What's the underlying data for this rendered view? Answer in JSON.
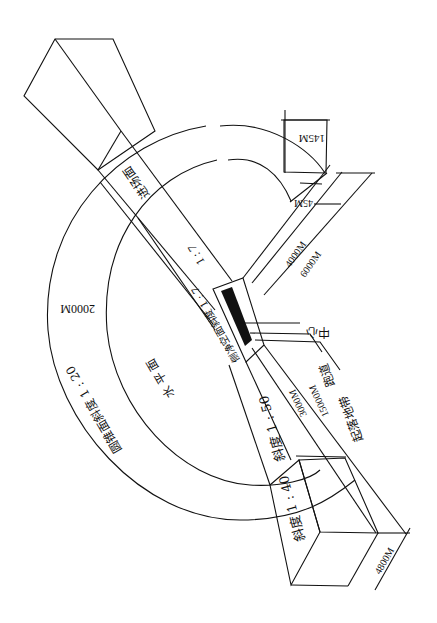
{
  "diagram": {
    "orientation_note": "rotated 180 degrees",
    "surfaces": {
      "approach_surface_top": "进场面",
      "approach_slope_top": "1 : 7",
      "transitional_surface": "侧净空面斜度 1 : 7",
      "inner_horizontal": "水 平 面",
      "conical_surface": "圆锥面斜度 1 : 20",
      "approach_slope_50": "斜度 1 : 50",
      "approach_slope_40": "斜度 1 : 40"
    },
    "callouts": {
      "center": "中心",
      "runway": "跑道",
      "strip": "起落地带"
    },
    "dimensions": {
      "conical_width": "2000M",
      "inner_edge_145": "145M",
      "inner_edge_45": "45M",
      "dist_4000": "4000M",
      "dist_6000": "6000M",
      "dist_3000": "3000M",
      "dist_15000": "15000M",
      "outer_width_4800": "4800M"
    }
  }
}
